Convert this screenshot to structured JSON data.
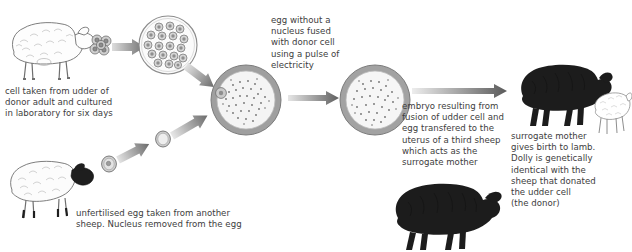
{
  "diagram": {
    "title_fragment": "",
    "captions": {
      "donor_cell": "cell taken from udder of\ndonor adult and cultured\nin laboratory for six days",
      "fusion": "egg without a\nnucleus fused\nwith donor cell\nusing a pulse of\nelectricity",
      "unfertilised_egg": "unfertilised egg taken from another\nsheep. Nucleus removed from the egg",
      "embryo_transfer": "embryo resulting from\nfusion of udder cell and\negg transfered to the\nuterus of a third sheep\nwhich acts as the\nsurrogate mother",
      "birth": "surrogate mother\ngives birth to lamb.\nDolly is genetically\nidentical with the\nsheep that donated\nthe udder cell\n(the donor)"
    },
    "figures": {
      "donor_sheep": "white-woolly-sheep-outline",
      "udder_cell_cluster": "udder-cell-cluster",
      "culture_dish": "petri-dish-cultured-cells",
      "egg_donor_sheep": "white-sheep-black-face",
      "unfertilised_egg": "small-egg-cell",
      "enucleated_egg": "small-egg-cell-no-nucleus",
      "fused_egg": "large-egg-cell-fused",
      "embryo": "large-embryo-cell",
      "surrogate_sheep": "black-sheep-surrogate",
      "dolly_sheep": "black-sheep-dolly",
      "lamb": "white-lamb-outline"
    },
    "arrows": {
      "a1": "arrow-cluster-to-dish",
      "a2": "arrow-dish-to-egg",
      "a3": "arrow-sheep-to-egg",
      "a4": "arrow-egg-to-enucleated",
      "a5": "arrow-enucleated-to-fused",
      "a6": "arrow-fused-to-embryo",
      "a7": "arrow-embryo-to-surrogate"
    },
    "colors": {
      "text": "#3d3d3d",
      "arrow_dark": "#6e6e6e",
      "arrow_light": "#d8d8d8",
      "cell_membrane": "#9a9a9a",
      "cell_fill": "#f2f2f2",
      "sheep_black": "#1d1d1d",
      "sheep_outline": "#6b6b6b",
      "background": "#ffffff"
    }
  }
}
